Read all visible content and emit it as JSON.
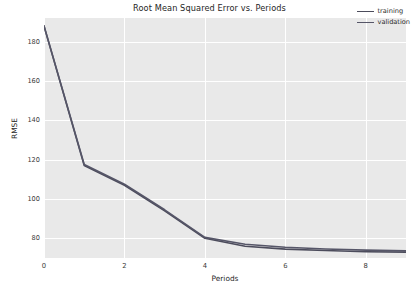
{
  "chart_data": {
    "type": "line",
    "title": "Root Mean Squared Error vs. Periods",
    "xlabel": "Periods",
    "ylabel": "RMSE",
    "x": [
      0,
      1,
      2,
      3,
      4,
      5,
      6,
      7,
      8,
      9
    ],
    "series": [
      {
        "name": "training",
        "color": "#4c4c5c",
        "values": [
          188,
          117,
          107,
          94,
          80,
          76,
          74.5,
          73.8,
          73.2,
          73.0
        ]
      },
      {
        "name": "validation",
        "color": "#565668",
        "values": [
          188,
          117.5,
          107.5,
          94.5,
          80.5,
          77,
          75.5,
          74.6,
          74.0,
          73.6
        ]
      }
    ],
    "xlim": [
      0,
      9
    ],
    "ylim": [
      70,
      192
    ],
    "xticks": [
      0,
      2,
      4,
      6,
      8
    ],
    "xtick_labels": [
      "0",
      "2",
      "4",
      "6",
      "8"
    ],
    "yticks": [
      80,
      100,
      120,
      140,
      160,
      180
    ],
    "ytick_labels": [
      "80",
      "100",
      "120",
      "140",
      "160",
      "180"
    ],
    "grid": true,
    "grid_color": "#ffffff",
    "plot_background": "#e9e9e9",
    "figure_background": "#ffffff",
    "legend_position": "upper right"
  },
  "legend": {
    "entries": [
      {
        "label": "training"
      },
      {
        "label": "validation"
      }
    ]
  }
}
